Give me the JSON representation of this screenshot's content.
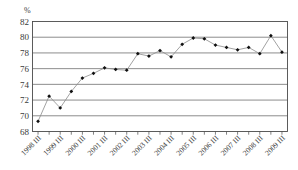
{
  "chart_data": {
    "type": "line",
    "title": "",
    "subtitle": "",
    "xlabel": "",
    "ylabel": "%",
    "unit_label": "%",
    "ylim": [
      68,
      82
    ],
    "ytick_labels": [
      "68",
      "70",
      "72",
      "74",
      "76",
      "78",
      "80",
      "82"
    ],
    "ytick_values": [
      68,
      70,
      72,
      74,
      76,
      78,
      80,
      82
    ],
    "grid": true,
    "grid_axis": "y",
    "legend": false,
    "legend_position": "none",
    "marker": "filled-diamond",
    "categories": [
      "1998 III",
      "1999 I",
      "1999 III",
      "2000 I",
      "2000 III",
      "2001 I",
      "2001 III",
      "2002 I",
      "2002 III",
      "2003 I",
      "2003 III",
      "2004 I",
      "2004 III",
      "2005 I",
      "2005 III",
      "2006 I",
      "2006 III",
      "2007 I",
      "2007 III",
      "2008 I",
      "2008 III",
      "2009 I",
      "2009 III"
    ],
    "xtick_labels": [
      "1998 III",
      "1999 III",
      "2000 III",
      "2001 III",
      "2002 III",
      "2003 III",
      "2004 III",
      "2005 III",
      "2006 III",
      "2007 III",
      "2008 III",
      "2009 III"
    ],
    "values": [
      69.3,
      72.5,
      71.0,
      73.1,
      74.8,
      75.4,
      76.1,
      75.9,
      75.8,
      77.9,
      77.6,
      78.3,
      77.5,
      79.1,
      79.9,
      79.8,
      79.0,
      78.7,
      78.4,
      78.7,
      77.9,
      80.2,
      78.1
    ],
    "series": [
      {
        "name": "series-1",
        "values": [
          69.3,
          72.5,
          71.0,
          73.1,
          74.8,
          75.4,
          76.1,
          75.9,
          75.8,
          77.9,
          77.6,
          78.3,
          77.5,
          79.1,
          79.9,
          79.8,
          79.0,
          78.7,
          78.4,
          78.7,
          77.9,
          80.2,
          78.1
        ],
        "color": "#8a8a8a",
        "marker_color": "#101010"
      }
    ]
  },
  "colors": {
    "background": "#ffffff",
    "grid": "#5a5a5a",
    "frame": "#4a4a4a",
    "line": "#8a8a8a",
    "marker": "#101010",
    "text": "#3a3a3a"
  }
}
